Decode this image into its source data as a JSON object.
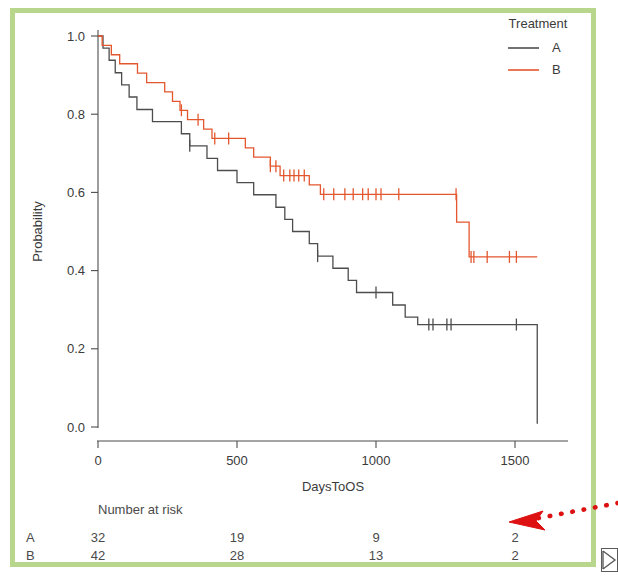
{
  "figure": {
    "border_color": "#b8d68c",
    "background": "#ffffff"
  },
  "legend": {
    "title": "Treatment",
    "entries": [
      {
        "label": "A",
        "color": "#4d4d4d"
      },
      {
        "label": "B",
        "color": "#e4572e"
      }
    ]
  },
  "annotation": {
    "arrow_color": "#dd1111",
    "arrow_name": "red-dotted-arrow"
  },
  "risk_table": {
    "title": "Number at risk",
    "times": [
      0,
      500,
      1000,
      1500
    ],
    "rows": [
      {
        "label": "A",
        "counts": [
          32,
          19,
          9,
          2
        ]
      },
      {
        "label": "B",
        "counts": [
          42,
          28,
          13,
          2
        ]
      }
    ]
  },
  "chart_data": {
    "type": "line",
    "title": "",
    "xlabel": "DaysToOS",
    "ylabel": "Probability",
    "xlim": [
      -60,
      1680
    ],
    "ylim": [
      0.0,
      1.02
    ],
    "xticks": [
      0,
      500,
      1000,
      1500
    ],
    "xtick_labels": [
      "0",
      "500",
      "1000",
      "1500"
    ],
    "yticks": [
      0.0,
      0.2,
      0.4,
      0.6,
      0.8,
      1.0
    ],
    "ytick_labels": [
      "0.0",
      "0.2",
      "0.4",
      "0.6",
      "0.8",
      "1.0"
    ],
    "grid": false,
    "legend_position": "top-right",
    "curve_style": "step-post",
    "series": [
      {
        "name": "A",
        "color": "#4d4d4d",
        "x": [
          0,
          18,
          40,
          62,
          85,
          112,
          140,
          165,
          196,
          228,
          262,
          300,
          330,
          360,
          392,
          430,
          470,
          500,
          520,
          560,
          600,
          640,
          672,
          700,
          730,
          760,
          790,
          818,
          845,
          870,
          900,
          930,
          960,
          1000,
          1060,
          1105,
          1150,
          1580,
          1580
        ],
        "y": [
          1.0,
          0.969,
          0.938,
          0.906,
          0.875,
          0.844,
          0.812,
          0.812,
          0.781,
          0.781,
          0.781,
          0.75,
          0.719,
          0.719,
          0.687,
          0.656,
          0.656,
          0.625,
          0.625,
          0.594,
          0.594,
          0.562,
          0.531,
          0.5,
          0.5,
          0.469,
          0.437,
          0.437,
          0.406,
          0.406,
          0.375,
          0.344,
          0.344,
          0.344,
          0.312,
          0.281,
          0.262,
          0.262,
          0.008
        ],
        "censor_times": [
          330,
          790,
          1000,
          1190,
          1205,
          1255,
          1270,
          1505
        ]
      },
      {
        "name": "B",
        "color": "#e4572e",
        "x": [
          0,
          15,
          48,
          78,
          108,
          142,
          175,
          208,
          240,
          268,
          295,
          322,
          352,
          380,
          410,
          440,
          472,
          500,
          530,
          560,
          590,
          620,
          655,
          690,
          725,
          760,
          800,
          1290,
          1335,
          1580
        ],
        "y": [
          1.0,
          0.976,
          0.952,
          0.929,
          0.929,
          0.905,
          0.881,
          0.881,
          0.857,
          0.833,
          0.81,
          0.786,
          0.786,
          0.762,
          0.738,
          0.738,
          0.738,
          0.738,
          0.714,
          0.69,
          0.69,
          0.667,
          0.643,
          0.643,
          0.643,
          0.619,
          0.595,
          0.524,
          0.435,
          0.435
        ],
        "censor_times": [
          300,
          360,
          420,
          470,
          620,
          640,
          668,
          690,
          705,
          722,
          742,
          812,
          848,
          888,
          918,
          952,
          972,
          1000,
          1018,
          1082,
          1288,
          1342,
          1352,
          1400,
          1480,
          1505
        ]
      }
    ]
  }
}
